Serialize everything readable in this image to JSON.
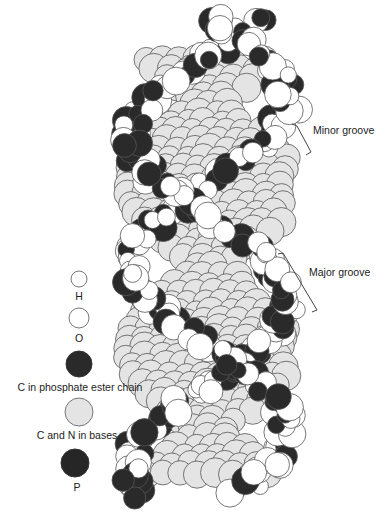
{
  "diagram": {
    "annotations": {
      "minor_groove": "Minor groove",
      "major_groove": "Major groove"
    },
    "legend": [
      {
        "label": "H",
        "fill": "#ffffff",
        "r": 8,
        "cx": 79,
        "cy": 279
      },
      {
        "label": "O",
        "fill": "#ffffff",
        "r": 10,
        "cx": 79,
        "cy": 318
      },
      {
        "label": "C in phosphate ester chain",
        "fill": "#2a2a2a",
        "r": 13,
        "cx": 79,
        "cy": 364
      },
      {
        "label": "C and N in bases",
        "fill": "#e4e4e4",
        "r": 14,
        "cx": 79,
        "cy": 412
      },
      {
        "label": "P",
        "fill": "#262626",
        "r": 14,
        "cx": 75,
        "cy": 463
      }
    ],
    "colors": {
      "hydrogen": "#ffffff",
      "oxygen": "#ffffff",
      "backbone_carbon": "#2a2a2a",
      "base_atoms": "#e4e4e4",
      "phosphorus": "#262626",
      "outline": "#555555"
    }
  }
}
